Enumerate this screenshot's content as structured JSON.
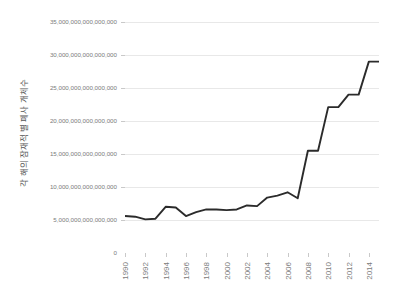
{
  "chart_data": {
    "type": "line",
    "title": "",
    "subtitle": "",
    "xlabel": "",
    "ylabel": "각 해의 잠재적 별 폐사 개체수",
    "grid": true,
    "legend": false,
    "legend_position": "none",
    "line_color": "#2b2b2b",
    "grid_color": "#e8e8e8",
    "tick_label_color": "#7b7b7b",
    "axis_title_color": "#555555",
    "background_color": "#ffffff",
    "xlim": [
      1990,
      2015
    ],
    "ylim": [
      0,
      35000000000000000
    ],
    "y_ticks": [
      0,
      5000000000000000,
      10000000000000000,
      15000000000000000,
      20000000000000000,
      25000000000000000,
      30000000000000000,
      35000000000000000
    ],
    "y_tick_labels": [
      "0",
      "5,000,000,000,000,000",
      "10,000,000,000,000,000",
      "15,000,000,000,000,000",
      "20,000,000,000,000,000",
      "25,000,000,000,000,000",
      "30,000,000,000,000,000",
      "35,000,000,000,000,000"
    ],
    "x_tick_labels": [
      "1990",
      "1992",
      "1994",
      "1996",
      "1998",
      "2000",
      "2002",
      "2004",
      "2006",
      "2008",
      "2010",
      "2012",
      "2014"
    ],
    "x": [
      1990,
      1991,
      1992,
      1993,
      1994,
      1995,
      1996,
      1997,
      1998,
      1999,
      2000,
      2001,
      2002,
      2003,
      2004,
      2005,
      2006,
      2007,
      2008,
      2009,
      2010,
      2011,
      2012,
      2013,
      2014,
      2015
    ],
    "values": [
      5600000000000000,
      5500000000000000,
      5100000000000000,
      5200000000000000,
      7000000000000000,
      6900000000000000,
      5600000000000000,
      6200000000000000,
      6600000000000000,
      6600000000000000,
      6500000000000000,
      6600000000000000,
      7200000000000000,
      7100000000000000,
      8400000000000000,
      8700000000000000,
      9200000000000000,
      8300000000000000,
      15500000000000000,
      15500000000000000,
      22100000000000000,
      22100000000000000,
      24000000000000000,
      24000000000000000,
      29000000000000000,
      29000000000000000
    ],
    "series": [
      {
        "name": "각 해의 잠재적 별 폐사 개체수",
        "values": [
          5600000000000000,
          5500000000000000,
          5100000000000000,
          5200000000000000,
          7000000000000000,
          6900000000000000,
          5600000000000000,
          6200000000000000,
          6600000000000000,
          6600000000000000,
          6500000000000000,
          6600000000000000,
          7200000000000000,
          7100000000000000,
          8400000000000000,
          8700000000000000,
          9200000000000000,
          8300000000000000,
          15500000000000000,
          15500000000000000,
          22100000000000000,
          22100000000000000,
          24000000000000000,
          24000000000000000,
          29000000000000000,
          29000000000000000
        ]
      }
    ]
  }
}
